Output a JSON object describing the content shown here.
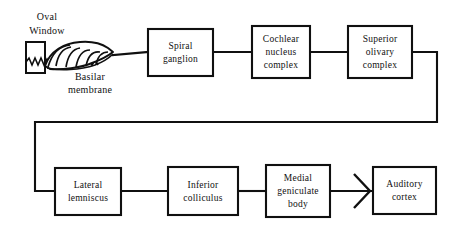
{
  "figure": {
    "background_color": "#ffffff",
    "line_color": "#101010"
  },
  "anatomy_labels": {
    "oval_window_line1": "Oval",
    "oval_window_line2": "Window",
    "basilar_line1": "Basilar",
    "basilar_line2": "membrane"
  },
  "nodes": [
    {
      "id": "spiral-ganglion",
      "lines": [
        "Spiral",
        "ganglion"
      ],
      "line1": "Spiral",
      "line2": "ganglion",
      "line3": ""
    },
    {
      "id": "cochlear-nucleus-complex",
      "lines": [
        "Cochlear",
        "nucleus",
        "complex"
      ],
      "line1": "Cochlear",
      "line2": "nucleus",
      "line3": "complex"
    },
    {
      "id": "superior-olivary-complex",
      "lines": [
        "Superior",
        "olivary",
        "complex"
      ],
      "line1": "Superior",
      "line2": "olivary",
      "line3": "complex"
    },
    {
      "id": "lateral-lemniscus",
      "lines": [
        "Lateral",
        "lemniscus"
      ],
      "line1": "Lateral",
      "line2": "lemniscus",
      "line3": ""
    },
    {
      "id": "inferior-colliculus",
      "lines": [
        "Inferior",
        "colliculus"
      ],
      "line1": "Inferior",
      "line2": "colliculus",
      "line3": ""
    },
    {
      "id": "medial-geniculate-body",
      "lines": [
        "Medial",
        "geniculate",
        "body"
      ],
      "line1": "Medial",
      "line2": "geniculate",
      "line3": "body"
    },
    {
      "id": "auditory-cortex",
      "lines": [
        "Auditory",
        "cortex"
      ],
      "line1": "Auditory",
      "line2": "cortex",
      "line3": ""
    }
  ]
}
